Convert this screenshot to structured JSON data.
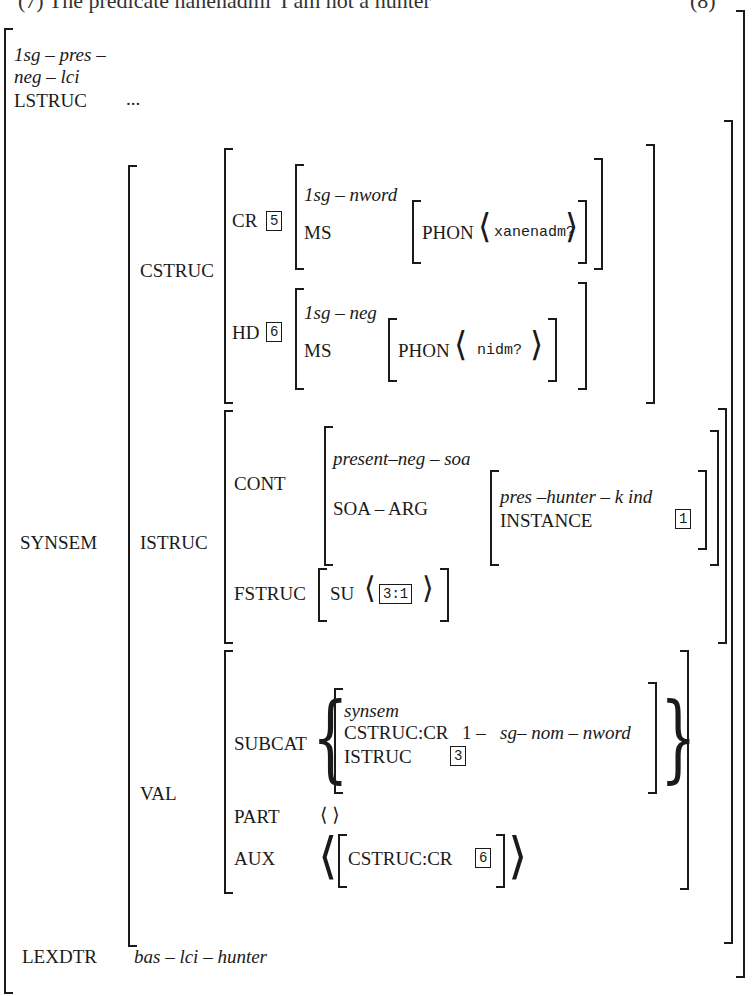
{
  "figure": {
    "title_fragment": "(7) The predicate nanenadmi 'I am not a hunter'",
    "number_fragment": "(8)",
    "type_label_line1": "1sg – pres –",
    "type_label_line2": "neg – lci",
    "lstruc": {
      "label": "LSTRUC",
      "value": "..."
    },
    "synsem": {
      "label": "SYNSEM",
      "cstruc": {
        "label": "CSTRUC",
        "cr": {
          "label": "CR",
          "tag": "5",
          "type": "1sg – nword",
          "ms_label": "MS",
          "phon_label": "PHON",
          "phon_value": "xanenadm?"
        },
        "hd": {
          "label": "HD",
          "tag": "6",
          "type": "1sg – neg",
          "ms_label": "MS",
          "phon_label": "PHON",
          "phon_value": "nidm?"
        }
      },
      "istruc": {
        "label": "ISTRUC",
        "cont": {
          "label": "CONT",
          "type": "present–neg – soa",
          "soa_arg_label": "SOA – ARG",
          "soa_arg": {
            "type": "pres –hunter – k ind",
            "instance_label": "INSTANCE",
            "instance_tag": "1"
          }
        },
        "fstruc": {
          "label": "FSTRUC",
          "su_label": "SU",
          "su_tag": "3:1"
        }
      },
      "val": {
        "label": "VAL",
        "subcat": {
          "label": "SUBCAT",
          "type": "synsem",
          "cstruc_cr_label": "CSTRUC:CR",
          "cstruc_cr_value_prefix": "1 –",
          "cstruc_cr_value": "sg– nom – nword",
          "istruc_label": "ISTRUC",
          "istruc_tag": "3"
        },
        "part": {
          "label": "PART",
          "value": "⟨ ⟩"
        },
        "aux": {
          "label": "AUX",
          "cstruc_cr_label": "CSTRUC:CR",
          "tag": "6"
        }
      }
    },
    "lexdtr": {
      "label": "LEXDTR",
      "value": "bas – lci – hunter"
    }
  }
}
